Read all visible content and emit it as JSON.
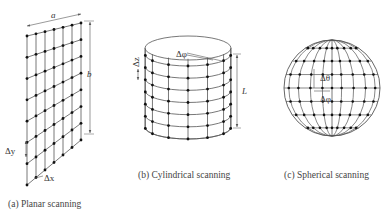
{
  "panels": {
    "planar": {
      "caption": "(a) Planar scanning",
      "labels": {
        "width": "a",
        "height": "b",
        "dy": "Δy",
        "dx": "Δx"
      },
      "grid": {
        "columns": 7,
        "rows": 8
      }
    },
    "cylindrical": {
      "caption": "(b) Cylindrical scanning",
      "labels": {
        "dphi": "Δφ",
        "dz": "Δz",
        "length": "L"
      },
      "grid": {
        "meridians_visible": 7,
        "rings": 7
      }
    },
    "spherical": {
      "caption": "(c) Spherical scanning",
      "labels": {
        "dtheta": "Δθ",
        "dphi": "Δφ"
      },
      "grid": {
        "meridians": 9,
        "parallels": 7
      }
    }
  },
  "colors": {
    "line": "#555555",
    "dot": "#111111",
    "background": "#ffffff"
  }
}
